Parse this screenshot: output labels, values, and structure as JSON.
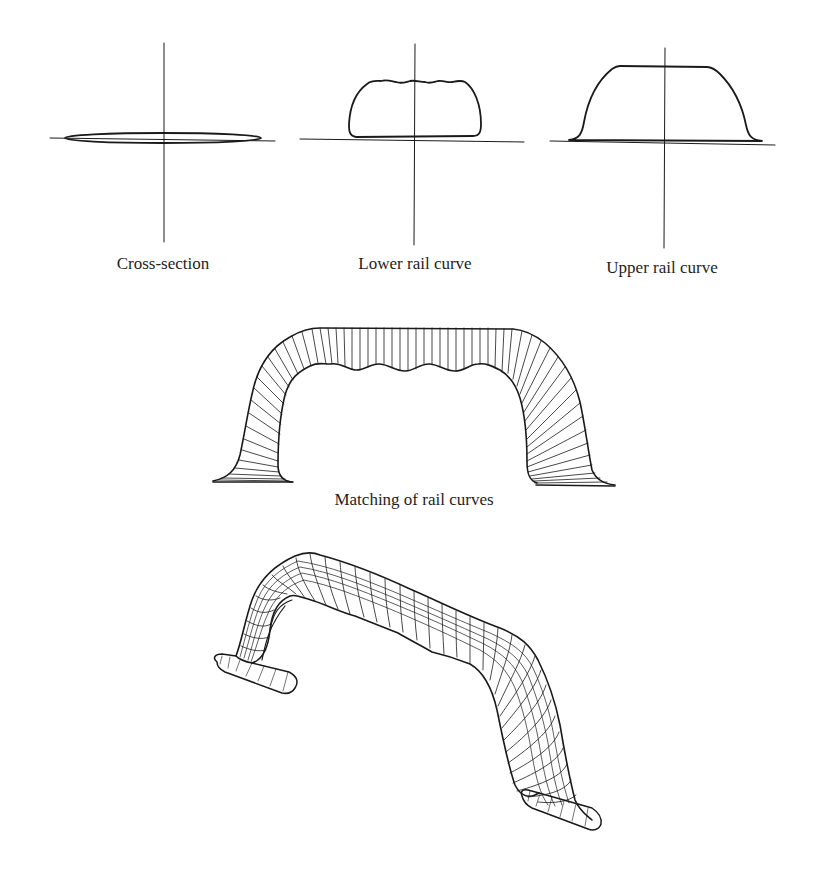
{
  "figure": {
    "panels": [
      {
        "id": "cross-section",
        "label": "Cross-section"
      },
      {
        "id": "lower-rail",
        "label": "Lower rail curve"
      },
      {
        "id": "upper-rail",
        "label": "Upper rail curve"
      }
    ],
    "matching": {
      "label": "Matching of rail curves"
    },
    "result": {
      "description": "3D wireframe swept surface (handle)"
    },
    "colors": {
      "ink": "#1a1a1a",
      "background": "#ffffff"
    }
  }
}
